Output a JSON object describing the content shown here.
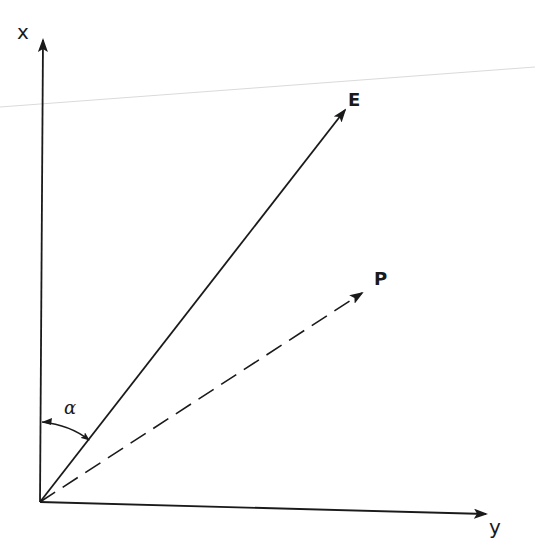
{
  "diagram": {
    "type": "vector-diagram",
    "colors": {
      "ink": "#1a1a1a",
      "background": "#ffffff",
      "scan_line": "#d9d9d9"
    },
    "origin": {
      "x": 40,
      "y": 502
    },
    "axes": [
      {
        "id": "x",
        "label": "x",
        "from": [
          40,
          502
        ],
        "to": [
          43,
          38
        ],
        "style": "solid"
      },
      {
        "id": "y",
        "label": "y",
        "from": [
          40,
          502
        ],
        "to": [
          487,
          514
        ],
        "style": "solid"
      }
    ],
    "vectors": [
      {
        "id": "E",
        "label": "E",
        "from": [
          40,
          502
        ],
        "to": [
          345,
          108
        ],
        "style": "solid"
      },
      {
        "id": "P",
        "label": "P",
        "from": [
          40,
          502
        ],
        "to": [
          363,
          292
        ],
        "style": "dashed"
      }
    ],
    "angle": {
      "label": "α",
      "between": [
        "x",
        "E"
      ],
      "description": "double-headed arc from x axis to vector E"
    },
    "labels": {
      "x_axis": "x",
      "y_axis": "y",
      "E_vector": "E",
      "P_vector": "P",
      "alpha": "α"
    }
  }
}
